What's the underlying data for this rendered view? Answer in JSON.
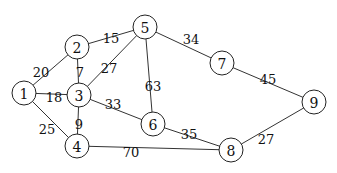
{
  "graph": {
    "type": "weighted-undirected-graph",
    "nodes": [
      {
        "id": "1",
        "label": "1",
        "x": 24,
        "y": 93
      },
      {
        "id": "2",
        "label": "2",
        "x": 77,
        "y": 47
      },
      {
        "id": "3",
        "label": "3",
        "x": 79,
        "y": 95
      },
      {
        "id": "4",
        "label": "4",
        "x": 77,
        "y": 146
      },
      {
        "id": "5",
        "label": "5",
        "x": 145,
        "y": 27
      },
      {
        "id": "6",
        "label": "6",
        "x": 153,
        "y": 124
      },
      {
        "id": "7",
        "label": "7",
        "x": 222,
        "y": 63
      },
      {
        "id": "8",
        "label": "8",
        "x": 231,
        "y": 150
      },
      {
        "id": "9",
        "label": "9",
        "x": 314,
        "y": 102
      }
    ],
    "edges": [
      {
        "from": "1",
        "to": "2",
        "weight": "20",
        "lx": 41,
        "ly": 72
      },
      {
        "from": "1",
        "to": "3",
        "weight": "18",
        "lx": 54,
        "ly": 97
      },
      {
        "from": "1",
        "to": "4",
        "weight": "25",
        "lx": 47,
        "ly": 129
      },
      {
        "from": "2",
        "to": "5",
        "weight": "15",
        "lx": 111,
        "ly": 38
      },
      {
        "from": "2",
        "to": "3",
        "weight": "7",
        "lx": 80,
        "ly": 72
      },
      {
        "from": "3",
        "to": "5",
        "weight": "27",
        "lx": 109,
        "ly": 68
      },
      {
        "from": "3",
        "to": "4",
        "weight": "9",
        "lx": 79,
        "ly": 124
      },
      {
        "from": "3",
        "to": "6",
        "weight": "33",
        "lx": 113,
        "ly": 104
      },
      {
        "from": "5",
        "to": "6",
        "weight": "63",
        "lx": 153,
        "ly": 86
      },
      {
        "from": "5",
        "to": "7",
        "weight": "34",
        "lx": 191,
        "ly": 39
      },
      {
        "from": "7",
        "to": "9",
        "weight": "45",
        "lx": 268,
        "ly": 79
      },
      {
        "from": "6",
        "to": "8",
        "weight": "35",
        "lx": 189,
        "ly": 134
      },
      {
        "from": "4",
        "to": "8",
        "weight": "70",
        "lx": 131,
        "ly": 152
      },
      {
        "from": "8",
        "to": "9",
        "weight": "27",
        "lx": 266,
        "ly": 139
      }
    ],
    "node_radius": 12
  }
}
